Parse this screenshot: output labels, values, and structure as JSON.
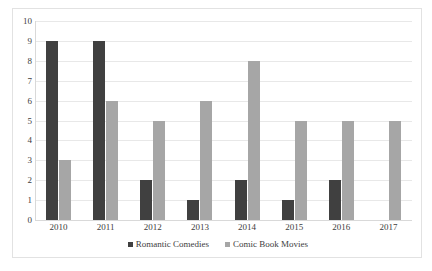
{
  "chart_data": {
    "type": "bar",
    "title": "",
    "xlabel": "",
    "ylabel": "",
    "ylim": [
      0,
      10
    ],
    "ytick_step": 1,
    "yticks": [
      10,
      9,
      8,
      7,
      6,
      5,
      4,
      3,
      2,
      1,
      0
    ],
    "grid": true,
    "legend_position": "bottom",
    "categories": [
      "2010",
      "2011",
      "2012",
      "2013",
      "2014",
      "2015",
      "2016",
      "2017"
    ],
    "series": [
      {
        "name": "Romantic Comedies",
        "color": "#404040",
        "values": [
          9,
          9,
          2,
          1,
          2,
          1,
          2,
          0
        ]
      },
      {
        "name": "Comic Book Movies",
        "color": "#a6a6a6",
        "values": [
          3,
          6,
          5,
          6,
          8,
          5,
          5,
          5
        ]
      }
    ]
  },
  "legend": {
    "items": [
      {
        "label": "Romantic Comedies"
      },
      {
        "label": "Comic Book Movies"
      }
    ]
  }
}
